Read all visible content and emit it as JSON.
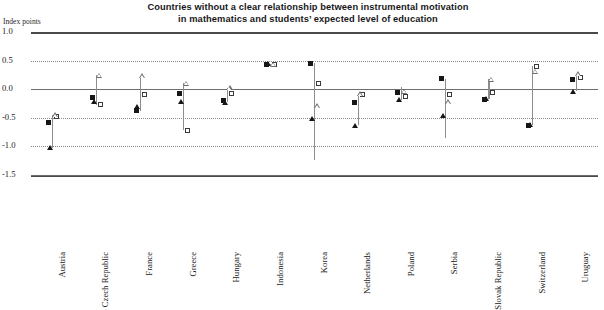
{
  "chart_data": {
    "type": "scatter",
    "title": "Countries without a clear relationship between instrumental motivation in mathematics and students’ expected level of education",
    "title_line1": "Countries without a clear relationship between instrumental motivation",
    "title_line2": "in mathematics and students’ expected level of education",
    "ylabel": "Index points",
    "xlabel": "",
    "ylim": [
      -1.5,
      1.0
    ],
    "yticks": [
      1.0,
      0.5,
      0.0,
      -0.5,
      -1.0,
      -1.5
    ],
    "ytick_labels": [
      "1.0",
      "0.5",
      "0.0",
      "-0.5",
      "-1.0",
      "-1.5"
    ],
    "grid": "horizontal-dotted",
    "zero_line": 0.0,
    "legend": [],
    "categories": [
      "Austria",
      "Czech Republic",
      "France",
      "Greece",
      "Hungary",
      "Indonesia",
      "Korea",
      "Netherlands",
      "Poland",
      "Serbia",
      "Slovak Republic",
      "Switzerland",
      "Uruguay"
    ],
    "series": [
      {
        "name": "filled-square",
        "marker": "filled-square",
        "values": [
          -0.58,
          -0.14,
          -0.38,
          -0.08,
          -0.19,
          0.44,
          0.45,
          -0.23,
          -0.05,
          0.18,
          -0.18,
          -0.63,
          0.17
        ]
      },
      {
        "name": "open-square",
        "marker": "open-square",
        "values": [
          -0.48,
          -0.27,
          -0.09,
          -0.72,
          -0.08,
          0.43,
          0.1,
          -0.09,
          -0.13,
          -0.1,
          -0.06,
          0.4,
          0.2
        ]
      },
      {
        "name": "filled-triangle",
        "marker": "filled-triangle",
        "values": [
          -1.02,
          -0.22,
          -0.31,
          -0.22,
          -0.23,
          0.44,
          -0.52,
          -0.63,
          -0.19,
          -0.47,
          -0.17,
          -0.62,
          -0.04
        ]
      },
      {
        "name": "open-triangle",
        "marker": "open-triangle",
        "values": [
          -0.45,
          0.24,
          0.23,
          0.1,
          0.02,
          0.43,
          -0.29,
          -0.08,
          -0.04,
          -0.22,
          0.17,
          0.31,
          0.27
        ]
      }
    ],
    "ranges": [
      {
        "category": "Austria",
        "low": -1.02,
        "high": -0.45
      },
      {
        "category": "Czech Republic",
        "low": -0.27,
        "high": 0.24
      },
      {
        "category": "France",
        "low": -0.38,
        "high": 0.23
      },
      {
        "category": "Greece",
        "low": -0.72,
        "high": 0.1
      },
      {
        "category": "Hungary",
        "low": -0.23,
        "high": 0.02
      },
      {
        "category": "Indonesia",
        "low": 0.43,
        "high": 0.44
      },
      {
        "category": "Korea",
        "low": -1.23,
        "high": 0.45
      },
      {
        "category": "Netherlands",
        "low": -0.63,
        "high": -0.08
      },
      {
        "category": "Poland",
        "low": -0.19,
        "high": 0.04
      },
      {
        "category": "Serbia",
        "low": -0.85,
        "high": 0.18
      },
      {
        "category": "Slovak Republic",
        "low": -0.18,
        "high": 0.17
      },
      {
        "category": "Switzerland",
        "low": -0.63,
        "high": 0.4
      },
      {
        "category": "Uruguay",
        "low": -0.04,
        "high": 0.27
      }
    ]
  }
}
